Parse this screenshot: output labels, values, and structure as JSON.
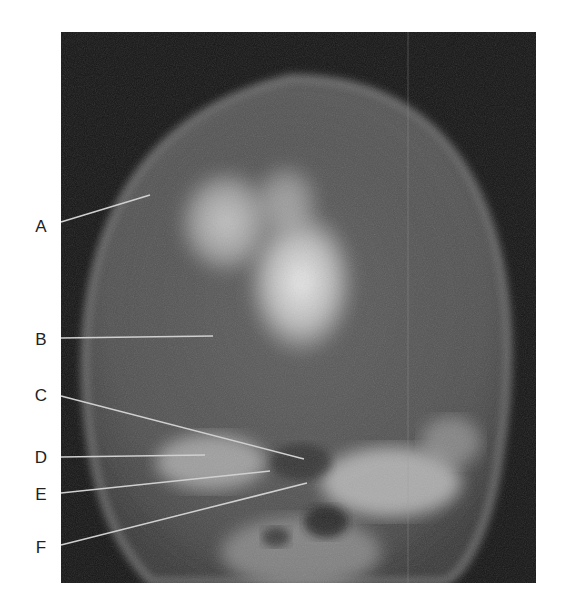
{
  "figure": {
    "type": "radiograph",
    "view": "skull x-ray (frontal/occipital projection)",
    "labels": [
      {
        "id": "A",
        "text": "A",
        "y": 226,
        "line": {
          "x1": 61,
          "y1": 222,
          "x2": 150,
          "y2": 195
        }
      },
      {
        "id": "B",
        "text": "B",
        "y": 339,
        "line": {
          "x1": 61,
          "y1": 338,
          "x2": 213,
          "y2": 336
        }
      },
      {
        "id": "C",
        "text": "C",
        "y": 395,
        "line": {
          "x1": 61,
          "y1": 396,
          "x2": 304,
          "y2": 459
        }
      },
      {
        "id": "D",
        "text": "D",
        "y": 457,
        "line": {
          "x1": 61,
          "y1": 457,
          "x2": 205,
          "y2": 455
        }
      },
      {
        "id": "E",
        "text": "E",
        "y": 494,
        "line": {
          "x1": 61,
          "y1": 493,
          "x2": 270,
          "y2": 471
        }
      },
      {
        "id": "F",
        "text": "F",
        "y": 547,
        "line": {
          "x1": 61,
          "y1": 545,
          "x2": 307,
          "y2": 483
        }
      }
    ]
  }
}
